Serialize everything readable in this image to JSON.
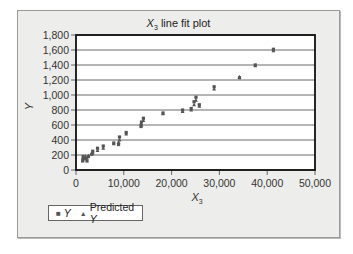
{
  "chart_data": {
    "type": "scatter",
    "title": "X3 line fit plot",
    "title_main": "X",
    "title_sub": "3",
    "title_rest": " line fit plot",
    "xlabel": "X3",
    "xlabel_main": "X",
    "xlabel_sub": "3",
    "ylabel": "Y",
    "xlim": [
      0,
      50000
    ],
    "ylim": [
      0,
      1800
    ],
    "x_ticks": [
      "0",
      "10,000",
      "20,000",
      "30,000",
      "40,000",
      "50,000"
    ],
    "y_ticks": [
      "0",
      "200",
      "400",
      "600",
      "800",
      "1,000",
      "1,200",
      "1,400",
      "1,600",
      "1,800"
    ],
    "grid": "horizontal",
    "legend_position": "bottom-left",
    "series": [
      {
        "name": "Y",
        "marker": "square",
        "points": [
          [
            1400,
            120
          ],
          [
            1500,
            180
          ],
          [
            2000,
            150
          ],
          [
            2300,
            120
          ],
          [
            2600,
            180
          ],
          [
            3300,
            210
          ],
          [
            3500,
            250
          ],
          [
            4500,
            290
          ],
          [
            5700,
            320
          ],
          [
            7900,
            360
          ],
          [
            8900,
            340
          ],
          [
            9100,
            440
          ],
          [
            10500,
            500
          ],
          [
            13600,
            580
          ],
          [
            13700,
            640
          ],
          [
            14100,
            690
          ],
          [
            18200,
            760
          ],
          [
            22300,
            800
          ],
          [
            24100,
            820
          ],
          [
            24700,
            910
          ],
          [
            25100,
            970
          ],
          [
            25800,
            870
          ],
          [
            28900,
            1110
          ],
          [
            34200,
            1230
          ],
          [
            37500,
            1400
          ],
          [
            41300,
            1610
          ]
        ]
      },
      {
        "name": "Predicted Y",
        "marker": "triangle",
        "points": [
          [
            1400,
            160
          ],
          [
            1500,
            150
          ],
          [
            2000,
            180
          ],
          [
            2300,
            160
          ],
          [
            2600,
            190
          ],
          [
            3300,
            220
          ],
          [
            3500,
            230
          ],
          [
            4500,
            260
          ],
          [
            5700,
            290
          ],
          [
            7900,
            350
          ],
          [
            8900,
            370
          ],
          [
            9100,
            400
          ],
          [
            10500,
            480
          ],
          [
            13600,
            620
          ],
          [
            13700,
            600
          ],
          [
            14100,
            660
          ],
          [
            18200,
            750
          ],
          [
            22300,
            780
          ],
          [
            24100,
            800
          ],
          [
            24700,
            870
          ],
          [
            25100,
            930
          ],
          [
            25800,
            850
          ],
          [
            28900,
            1080
          ],
          [
            34200,
            1240
          ],
          [
            37500,
            1390
          ],
          [
            41300,
            1590
          ]
        ]
      }
    ]
  },
  "legend": {
    "items": [
      {
        "marker": "■",
        "label": "Y"
      },
      {
        "marker": "▲",
        "label": "Predicted Y"
      }
    ]
  },
  "colors": {
    "frame_bg": "#ededeb",
    "plot_bg": "#ffffff",
    "marker": "#555555",
    "grid": "#444444"
  }
}
